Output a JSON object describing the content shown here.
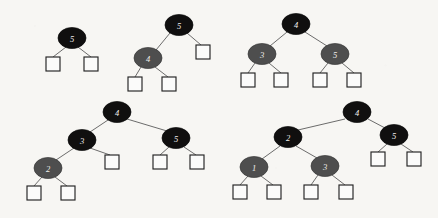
{
  "figure": {
    "kind": "red-black-tree-diagram-set",
    "width": 438,
    "height": 218,
    "background_color": "#f7f6f3",
    "edge_color": "#5b5b5b",
    "black_node_color": "#100f0f",
    "gray_node_color": "#4e4e4e",
    "leaf_fill_color": "#fbfbfa",
    "leaf_stroke_color": "#232323",
    "node_label_color": "#efeeec",
    "node_rx": 14,
    "node_ry": 10.5,
    "leaf_size": 14
  },
  "trees": [
    {
      "id": "tree-1",
      "name": "tree-single-node",
      "nodes": [
        {
          "id": "t1-n5",
          "label": "5",
          "color": "black",
          "cx": 72,
          "cy": 38
        }
      ],
      "leaves": [
        {
          "id": "t1-l1",
          "x": 46,
          "y": 57
        },
        {
          "id": "t1-l2",
          "x": 84,
          "y": 57
        }
      ],
      "edges": [
        {
          "from": "t1-n5",
          "to": "t1-l1",
          "x1": 66,
          "y1": 47,
          "x2": 53,
          "y2": 57
        },
        {
          "from": "t1-n5",
          "to": "t1-l2",
          "x1": 78,
          "y1": 47,
          "x2": 91,
          "y2": 57
        }
      ]
    },
    {
      "id": "tree-2",
      "name": "tree-left-child",
      "nodes": [
        {
          "id": "t2-n5",
          "label": "5",
          "color": "black",
          "cx": 179,
          "cy": 25
        },
        {
          "id": "t2-n4",
          "label": "4",
          "color": "gray",
          "cx": 148,
          "cy": 58
        }
      ],
      "leaves": [
        {
          "id": "t2-l1",
          "x": 128,
          "y": 77
        },
        {
          "id": "t2-l2",
          "x": 162,
          "y": 77
        },
        {
          "id": "t2-l3",
          "x": 196,
          "y": 45
        }
      ],
      "edges": [
        {
          "from": "t2-n5",
          "to": "t2-n4",
          "x1": 170,
          "y1": 33,
          "x2": 156,
          "y2": 50
        },
        {
          "from": "t2-n5",
          "to": "t2-l3",
          "x1": 187,
          "y1": 33,
          "x2": 201,
          "y2": 45
        },
        {
          "from": "t2-n4",
          "to": "t2-l1",
          "x1": 141,
          "y1": 67,
          "x2": 135,
          "y2": 77
        },
        {
          "from": "t2-n4",
          "to": "t2-l2",
          "x1": 155,
          "y1": 67,
          "x2": 168,
          "y2": 77
        }
      ]
    },
    {
      "id": "tree-3",
      "name": "tree-two-children",
      "nodes": [
        {
          "id": "t3-n4",
          "label": "4",
          "color": "black",
          "cx": 296,
          "cy": 24
        },
        {
          "id": "t3-n3",
          "label": "3",
          "color": "gray",
          "cx": 262,
          "cy": 54
        },
        {
          "id": "t3-n5",
          "label": "5",
          "color": "gray",
          "cx": 335,
          "cy": 54
        }
      ],
      "leaves": [
        {
          "id": "t3-l1",
          "x": 241,
          "y": 73
        },
        {
          "id": "t3-l2",
          "x": 274,
          "y": 73
        },
        {
          "id": "t3-l3",
          "x": 313,
          "y": 73
        },
        {
          "id": "t3-l4",
          "x": 347,
          "y": 73
        }
      ],
      "edges": [
        {
          "from": "t3-n4",
          "to": "t3-n3",
          "x1": 287,
          "y1": 32,
          "x2": 270,
          "y2": 46
        },
        {
          "from": "t3-n4",
          "to": "t3-n5",
          "x1": 305,
          "y1": 32,
          "x2": 327,
          "y2": 46
        },
        {
          "from": "t3-n3",
          "to": "t3-l1",
          "x1": 255,
          "y1": 63,
          "x2": 248,
          "y2": 73
        },
        {
          "from": "t3-n3",
          "to": "t3-l2",
          "x1": 269,
          "y1": 63,
          "x2": 281,
          "y2": 73
        },
        {
          "from": "t3-n5",
          "to": "t3-l3",
          "x1": 328,
          "y1": 63,
          "x2": 320,
          "y2": 73
        },
        {
          "from": "t3-n5",
          "to": "t3-l4",
          "x1": 342,
          "y1": 63,
          "x2": 354,
          "y2": 73
        }
      ]
    },
    {
      "id": "tree-4",
      "name": "tree-left-deep",
      "nodes": [
        {
          "id": "t4-n4",
          "label": "4",
          "color": "black",
          "cx": 117,
          "cy": 112
        },
        {
          "id": "t4-n3",
          "label": "3",
          "color": "black",
          "cx": 82,
          "cy": 140
        },
        {
          "id": "t4-n5",
          "label": "5",
          "color": "black",
          "cx": 176,
          "cy": 138
        },
        {
          "id": "t4-n2",
          "label": "2",
          "color": "gray",
          "cx": 48,
          "cy": 168
        }
      ],
      "leaves": [
        {
          "id": "t4-l1",
          "x": 27,
          "y": 186
        },
        {
          "id": "t4-l2",
          "x": 61,
          "y": 186
        },
        {
          "id": "t4-l3",
          "x": 105,
          "y": 155
        },
        {
          "id": "t4-l4",
          "x": 153,
          "y": 155
        },
        {
          "id": "t4-l5",
          "x": 190,
          "y": 155
        }
      ],
      "edges": [
        {
          "from": "t4-n4",
          "to": "t4-n3",
          "x1": 108,
          "y1": 120,
          "x2": 90,
          "y2": 132
        },
        {
          "from": "t4-n4",
          "to": "t4-n5",
          "x1": 127,
          "y1": 119,
          "x2": 167,
          "y2": 131
        },
        {
          "from": "t4-n3",
          "to": "t4-n2",
          "x1": 74,
          "y1": 148,
          "x2": 56,
          "y2": 160
        },
        {
          "from": "t4-n3",
          "to": "t4-l3",
          "x1": 90,
          "y1": 148,
          "x2": 110,
          "y2": 155
        },
        {
          "from": "t4-n2",
          "to": "t4-l1",
          "x1": 42,
          "y1": 177,
          "x2": 34,
          "y2": 186
        },
        {
          "from": "t4-n2",
          "to": "t4-l2",
          "x1": 55,
          "y1": 177,
          "x2": 67,
          "y2": 186
        },
        {
          "from": "t4-n5",
          "to": "t4-l4",
          "x1": 169,
          "y1": 147,
          "x2": 160,
          "y2": 155
        },
        {
          "from": "t4-n5",
          "to": "t4-l5",
          "x1": 184,
          "y1": 147,
          "x2": 196,
          "y2": 155
        }
      ]
    },
    {
      "id": "tree-5",
      "name": "tree-balanced-deep",
      "nodes": [
        {
          "id": "t5-n4",
          "label": "4",
          "color": "black",
          "cx": 357,
          "cy": 112
        },
        {
          "id": "t5-n2",
          "label": "2",
          "color": "black",
          "cx": 288,
          "cy": 137
        },
        {
          "id": "t5-n5",
          "label": "5",
          "color": "black",
          "cx": 394,
          "cy": 135
        },
        {
          "id": "t5-n1",
          "label": "1",
          "color": "gray",
          "cx": 254,
          "cy": 167
        },
        {
          "id": "t5-n3",
          "label": "3",
          "color": "gray",
          "cx": 325,
          "cy": 166
        }
      ],
      "leaves": [
        {
          "id": "t5-l1",
          "x": 233,
          "y": 185
        },
        {
          "id": "t5-l2",
          "x": 267,
          "y": 185
        },
        {
          "id": "t5-l3",
          "x": 304,
          "y": 185
        },
        {
          "id": "t5-l4",
          "x": 339,
          "y": 185
        },
        {
          "id": "t5-l5",
          "x": 371,
          "y": 152
        },
        {
          "id": "t5-l6",
          "x": 407,
          "y": 152
        }
      ],
      "edges": [
        {
          "from": "t5-n4",
          "to": "t5-n2",
          "x1": 345,
          "y1": 119,
          "x2": 298,
          "y2": 130
        },
        {
          "from": "t5-n4",
          "to": "t5-n5",
          "x1": 368,
          "y1": 119,
          "x2": 385,
          "y2": 128
        },
        {
          "from": "t5-n2",
          "to": "t5-n1",
          "x1": 280,
          "y1": 146,
          "x2": 262,
          "y2": 159
        },
        {
          "from": "t5-n2",
          "to": "t5-n3",
          "x1": 296,
          "y1": 146,
          "x2": 317,
          "y2": 158
        },
        {
          "from": "t5-n1",
          "to": "t5-l1",
          "x1": 248,
          "y1": 176,
          "x2": 240,
          "y2": 185
        },
        {
          "from": "t5-n1",
          "to": "t5-l2",
          "x1": 261,
          "y1": 176,
          "x2": 273,
          "y2": 185
        },
        {
          "from": "t5-n3",
          "to": "t5-l3",
          "x1": 318,
          "y1": 175,
          "x2": 311,
          "y2": 185
        },
        {
          "from": "t5-n3",
          "to": "t5-l4",
          "x1": 332,
          "y1": 175,
          "x2": 345,
          "y2": 185
        },
        {
          "from": "t5-n5",
          "to": "t5-l5",
          "x1": 387,
          "y1": 144,
          "x2": 378,
          "y2": 152
        },
        {
          "from": "t5-n5",
          "to": "t5-l6",
          "x1": 401,
          "y1": 144,
          "x2": 413,
          "y2": 152
        }
      ]
    }
  ]
}
